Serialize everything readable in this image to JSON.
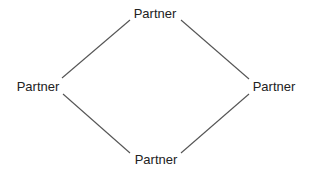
{
  "diagram": {
    "type": "diamond-network",
    "nodes": [
      {
        "id": "top",
        "label": "Partner"
      },
      {
        "id": "left",
        "label": "Partner"
      },
      {
        "id": "right",
        "label": "Partner"
      },
      {
        "id": "bottom",
        "label": "Partner"
      }
    ],
    "edges": [
      {
        "from": "top",
        "to": "left"
      },
      {
        "from": "top",
        "to": "right"
      },
      {
        "from": "left",
        "to": "bottom"
      },
      {
        "from": "right",
        "to": "bottom"
      }
    ],
    "colors": {
      "background": "#ffffff",
      "line": "#555555",
      "text": "#222222"
    }
  }
}
